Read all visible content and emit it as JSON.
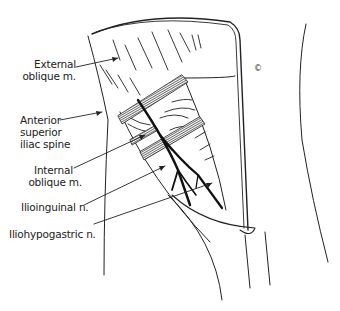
{
  "figure": {
    "type": "anatomical-line-drawing",
    "copyright_mark": "©",
    "colors": {
      "ink": "#222222",
      "background": "#ffffff",
      "hatch": "#555555"
    }
  },
  "labels": [
    {
      "id": "external-oblique",
      "lines": [
        "External",
        "oblique m."
      ]
    },
    {
      "id": "asis",
      "lines": [
        "Anterior",
        "superior",
        "iliac spine"
      ]
    },
    {
      "id": "internal-oblique",
      "lines": [
        "Internal",
        "oblique m."
      ]
    },
    {
      "id": "ilioinguinal",
      "lines": [
        "Ilioinguinal n."
      ]
    },
    {
      "id": "iliohypogastric",
      "lines": [
        "Iliohypogastric n."
      ]
    }
  ]
}
